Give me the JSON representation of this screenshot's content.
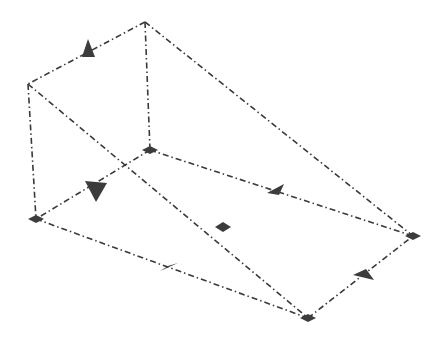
{
  "diagram": {
    "type": "wedge-wireframe",
    "colors": {
      "edge": "#3a3a3a",
      "marker": "#3c3c3c",
      "background": "#ffffff"
    },
    "vertices": {
      "A": [
        145,
        22
      ],
      "B": [
        28,
        84
      ],
      "C": [
        150,
        150
      ],
      "D": [
        36,
        219
      ],
      "E": [
        413,
        236
      ],
      "F": [
        308,
        318
      ]
    },
    "edges": [
      [
        "A",
        "B"
      ],
      [
        "A",
        "C"
      ],
      [
        "A",
        "E"
      ],
      [
        "B",
        "D"
      ],
      [
        "B",
        "F"
      ],
      [
        "C",
        "D"
      ],
      [
        "C",
        "E"
      ],
      [
        "D",
        "F"
      ],
      [
        "F",
        "E"
      ]
    ],
    "vertex_markers": [
      "C",
      "D",
      "E",
      "F"
    ],
    "arrow_markers": [
      {
        "x": 88,
        "y": 49,
        "dir": "up"
      },
      {
        "x": 96,
        "y": 188,
        "dir": "down"
      },
      {
        "x": 276,
        "y": 191,
        "dir": "edge-ce"
      },
      {
        "x": 168,
        "y": 266,
        "dir": "edge-df"
      },
      {
        "x": 362,
        "y": 276,
        "dir": "edge-fe"
      }
    ],
    "center_marker": [
      223,
      227
    ]
  }
}
